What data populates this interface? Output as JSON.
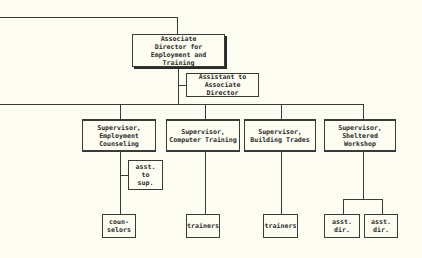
{
  "chart": {
    "director": "Associate\nDirector for\nEmployment and Training",
    "assistant": "Assistant to\nAssociate Director",
    "supervisors": [
      "Supervisor,\nEmployment\nCounseling",
      "Supervisor,\nComputer Training",
      "Supervisor,\nBuilding Trades",
      "Supervisor,\nSheltered\nWorkshop"
    ],
    "asst_to_sup": "asst.\nto\nsup.",
    "counselors": "coun-\nselors",
    "trainers_1": "trainers",
    "trainers_2": "trainers",
    "asst_dir_1": "asst.\ndir.",
    "asst_dir_2": "asst.\ndir."
  }
}
